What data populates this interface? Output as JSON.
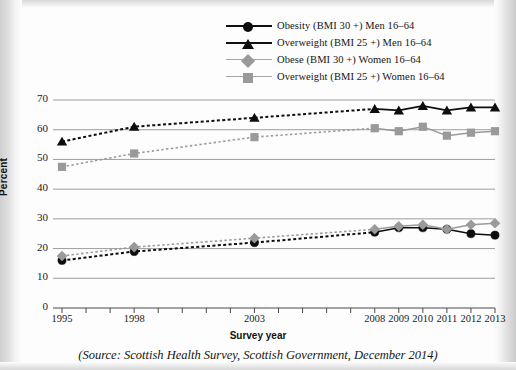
{
  "legend": {
    "items": [
      {
        "label": "Obesity (BMI 30 +) Men 16–64",
        "marker": "circle-dark-icon",
        "line": "dark"
      },
      {
        "label": "Overweight (BMI 25 +) Men 16–64",
        "marker": "triangle-dark-icon",
        "line": "dark"
      },
      {
        "label": "Obese (BMI 30 +) Women 16–64",
        "marker": "diamond-light-icon",
        "line": "light"
      },
      {
        "label": "Overweight (BMI 25 +) Women 16–64",
        "marker": "square-light-icon",
        "line": "light"
      }
    ]
  },
  "axes": {
    "y_label": "Percent",
    "x_label": "Survey year",
    "y_ticks": [
      "0",
      "10",
      "20",
      "30",
      "40",
      "50",
      "60",
      "70"
    ],
    "x_ticks": [
      "1995",
      "1998",
      "2003",
      "2008",
      "2009",
      "2010",
      "2011",
      "2012",
      "2013"
    ]
  },
  "source": "(Source: Scottish Health Survey, Scottish Government, December 2014)",
  "colors": {
    "dark": "#0d0d0d",
    "light": "#9a9a9a",
    "gridline": "#9e9e9e",
    "text": "#141414"
  },
  "chart_data": {
    "type": "line",
    "title": "",
    "xlabel": "Survey year",
    "ylabel": "Percent",
    "ylim": [
      0,
      70
    ],
    "grid": true,
    "legend_position": "top-right",
    "x": [
      1995,
      1998,
      2003,
      2008,
      2009,
      2010,
      2011,
      2012,
      2013
    ],
    "x_tick_labels": [
      "1995",
      "1998",
      "2003",
      "2008",
      "2009",
      "2010",
      "2011",
      "2012",
      "2013"
    ],
    "x_all_ticks": [
      1995,
      1996,
      1997,
      1998,
      1999,
      2000,
      2001,
      2002,
      2003,
      2004,
      2005,
      2006,
      2007,
      2008,
      2009,
      2010,
      2011,
      2012,
      2013
    ],
    "series": [
      {
        "name": "Obesity (BMI 30 +) Men 16–64",
        "marker": "circle",
        "color": "#0d0d0d",
        "values": [
          16,
          19,
          22,
          25.5,
          27,
          27,
          26.5,
          25,
          24.5
        ]
      },
      {
        "name": "Overweight (BMI 25 +) Men 16–64",
        "marker": "triangle",
        "color": "#0d0d0d",
        "values": [
          56,
          61,
          64,
          67,
          66.5,
          68,
          66.5,
          67.5,
          67.5
        ]
      },
      {
        "name": "Obese (BMI 30 +) Women 16–64",
        "marker": "diamond",
        "color": "#9a9a9a",
        "values": [
          17.5,
          20.5,
          23.5,
          26.5,
          27.5,
          28,
          26.5,
          28,
          28.5
        ]
      },
      {
        "name": "Overweight (BMI 25 +) Women 16–64",
        "marker": "square",
        "color": "#9a9a9a",
        "values": [
          47.5,
          52,
          57.5,
          60.5,
          59.5,
          61,
          58,
          59,
          59.5
        ]
      }
    ]
  }
}
